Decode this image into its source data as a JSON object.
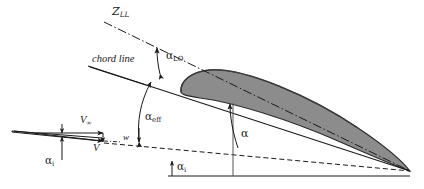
{
  "figure": {
    "type": "aerodynamics-diagram",
    "background_color": "#ffffff",
    "ink_color": "#1a1a1a",
    "airfoil_fill": "#8c8c8c",
    "airfoil_stroke": "#2b2b2b"
  },
  "labels": {
    "zero_lift_line": {
      "text": "Z",
      "sub": "LL",
      "x": 112,
      "y": 8
    },
    "chord_line": {
      "text": "chord line",
      "x": 92,
      "y": 56
    },
    "alpha_lo": {
      "text": "α",
      "sub": "LO",
      "x": 166,
      "y": 52
    },
    "alpha_eff": {
      "text": "α",
      "sub": "eff",
      "x": 145,
      "y": 113
    },
    "alpha_main": {
      "text": "α",
      "x": 227,
      "y": 131
    },
    "alpha_i_bottom": {
      "text": "α",
      "sub": "i",
      "x": 175,
      "y": 163
    },
    "alpha_i_left": {
      "text": "α",
      "sub": "i",
      "x": 45,
      "y": 159
    },
    "v_infinity": {
      "text": "V",
      "sub": "∞",
      "x": 89,
      "y": 118
    },
    "v_local": {
      "text": "V",
      "x": 95,
      "y": 145
    },
    "w_downwash": {
      "text": "w",
      "x": 124,
      "y": 135
    }
  },
  "geometry": {
    "trailing_edge": {
      "x": 410,
      "y": 171
    },
    "zll_line": {
      "x1": 104,
      "y1": 22,
      "x2": 410,
      "y2": 171
    },
    "chord_line": {
      "x1": 88,
      "y1": 66,
      "x2": 410,
      "y2": 171
    },
    "freestream_dashed": {
      "x1": 104,
      "y1": 143,
      "x2": 410,
      "y2": 171
    },
    "ground_solid": {
      "x1": 168,
      "y1": 176,
      "x2": 410,
      "y2": 176
    },
    "alpha_vertical": {
      "x": 233,
      "y_top": 101,
      "y_bottom": 176
    }
  }
}
